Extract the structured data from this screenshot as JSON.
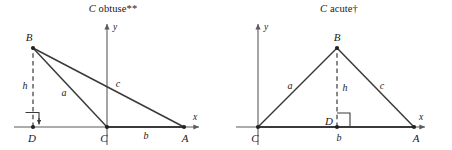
{
  "figure": {
    "background_color": "#ffffff",
    "stroke_color": "#3a3a3a",
    "axis_color": "#5a5a5a",
    "text_color": "#1a1a1a",
    "panels": [
      {
        "id": "obtuse",
        "title_math": "C",
        "title_rest": " obtuse**",
        "axes": {
          "x_label": "x",
          "y_label": "y"
        },
        "vertices": [
          {
            "name": "B",
            "label": "B"
          },
          {
            "name": "D",
            "label": "D"
          },
          {
            "name": "C",
            "label": "C"
          },
          {
            "name": "A",
            "label": "A"
          }
        ],
        "sides": [
          {
            "name": "h",
            "label": "h",
            "style": "dashed"
          },
          {
            "name": "a",
            "label": "a",
            "style": "solid"
          },
          {
            "name": "c",
            "label": "c",
            "style": "solid"
          },
          {
            "name": "b",
            "label": "b",
            "style": "solid"
          }
        ]
      },
      {
        "id": "acute",
        "title_math": "C",
        "title_rest": " acute†",
        "axes": {
          "x_label": "x",
          "y_label": "y"
        },
        "vertices": [
          {
            "name": "B",
            "label": "B"
          },
          {
            "name": "C",
            "label": "C"
          },
          {
            "name": "D",
            "label": "D"
          },
          {
            "name": "A",
            "label": "A"
          }
        ],
        "sides": [
          {
            "name": "a",
            "label": "a",
            "style": "solid"
          },
          {
            "name": "h",
            "label": "h",
            "style": "dashed"
          },
          {
            "name": "c",
            "label": "c",
            "style": "solid"
          },
          {
            "name": "b",
            "label": "b",
            "style": "solid"
          }
        ]
      }
    ]
  }
}
